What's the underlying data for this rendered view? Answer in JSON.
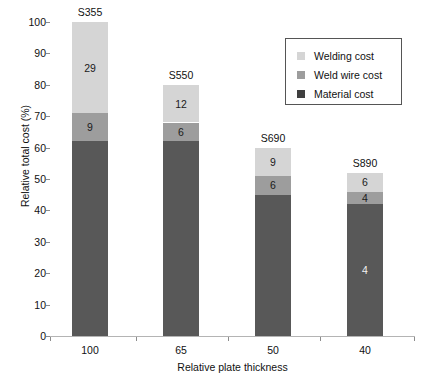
{
  "chart_data": {
    "type": "bar",
    "subtype": "stacked-vertical",
    "title": "",
    "xlabel": "Relative plate thickness",
    "ylabel": "Relative total cost (%)",
    "ylim": [
      0,
      100
    ],
    "ytick_step": 10,
    "yticks": [
      "100",
      "90",
      "80",
      "70",
      "60",
      "50",
      "40",
      "30",
      "20",
      "10",
      "0"
    ],
    "grid": true,
    "grid_axis": "y",
    "legend_position": "top-right-inside",
    "categories": [
      "100",
      "65",
      "50",
      "40"
    ],
    "group_annotations": [
      "S355",
      "S550",
      "S690",
      "S890"
    ],
    "series": [
      {
        "name": "Material cost",
        "color": "#585858",
        "values": [
          62,
          62,
          45,
          42
        ],
        "labels": [
          "",
          "",
          "",
          "4"
        ]
      },
      {
        "name": "Weld wire cost",
        "color": "#9d9d9d",
        "values": [
          9,
          6,
          6,
          4
        ],
        "labels": [
          "9",
          "6",
          "6",
          "4"
        ]
      },
      {
        "name": "Welding cost",
        "color": "#d5d5d5",
        "values": [
          29,
          12,
          9,
          6
        ],
        "labels": [
          "29",
          "12",
          "9",
          "6"
        ]
      }
    ],
    "totals": [
      100,
      80,
      60,
      52
    ]
  },
  "legend": {
    "items": [
      {
        "label": "Welding cost",
        "color": "#d5d5d5"
      },
      {
        "label": "Weld wire cost",
        "color": "#9d9d9d"
      },
      {
        "label": "Material cost",
        "color": "#3f3f3f"
      }
    ]
  },
  "bars": [
    {
      "annotation": "S355",
      "tick": "100",
      "material": {
        "value": 62,
        "label": ""
      },
      "wire": {
        "value": 9,
        "label": "9"
      },
      "welding": {
        "value": 29,
        "label": "29"
      }
    },
    {
      "annotation": "S550",
      "tick": "65",
      "material": {
        "value": 62,
        "label": ""
      },
      "wire": {
        "value": 6,
        "label": "6"
      },
      "welding": {
        "value": 12,
        "label": "12"
      }
    },
    {
      "annotation": "S690",
      "tick": "50",
      "material": {
        "value": 45,
        "label": ""
      },
      "wire": {
        "value": 6,
        "label": "6"
      },
      "welding": {
        "value": 9,
        "label": "9"
      }
    },
    {
      "annotation": "S890",
      "tick": "40",
      "material": {
        "value": 42,
        "label": "4"
      },
      "wire": {
        "value": 4,
        "label": "4"
      },
      "welding": {
        "value": 6,
        "label": "6"
      }
    }
  ]
}
